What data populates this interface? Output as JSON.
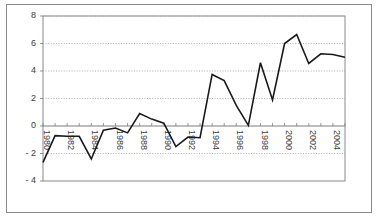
{
  "chart_data": {
    "type": "line",
    "title": "",
    "subtitle": "",
    "xlabel": "",
    "ylabel": "",
    "grid": true,
    "legend": false,
    "legend_position": "none",
    "xlim": [
      1980,
      2005
    ],
    "ylim": [
      -4,
      8
    ],
    "yticks": [
      -4,
      -2,
      0,
      2,
      4,
      6,
      8
    ],
    "ytick_labels": [
      "- 4",
      "- 2",
      "0",
      "2",
      "4",
      "6",
      "8"
    ],
    "xticks": [
      1980,
      1982,
      1984,
      1986,
      1988,
      1990,
      1992,
      1994,
      1996,
      1998,
      2000,
      2002,
      2004
    ],
    "xtick_labels": [
      "1980",
      "1982",
      "1984",
      "1986",
      "1988",
      "1990",
      "1992",
      "1994",
      "1996",
      "1998",
      "2000",
      "2002",
      "2004"
    ],
    "xtick_rotation": 90,
    "x": [
      1980,
      1981,
      1982,
      1983,
      1984,
      1985,
      1986,
      1987,
      1988,
      1989,
      1990,
      1991,
      1992,
      1993,
      1994,
      1995,
      1996,
      1997,
      1998,
      1999,
      2000,
      2001,
      2002,
      2003,
      2004,
      2005
    ],
    "series": [
      {
        "name": "series-1",
        "color": "#1a1a1a",
        "line_width": 1.6,
        "markers": false,
        "values": [
          -2.65,
          -0.7,
          -0.75,
          -0.75,
          -2.4,
          -0.3,
          -0.15,
          -0.5,
          0.9,
          0.5,
          0.2,
          -1.5,
          -0.8,
          -0.85,
          3.75,
          3.3,
          1.5,
          0.05,
          4.6,
          1.9,
          6.0,
          6.65,
          4.55,
          5.25,
          5.2,
          5.0
        ]
      }
    ],
    "colors": {
      "line": "#1a1a1a",
      "grid": "#9a9a9a",
      "axis": "#7d7d7d",
      "frame": "#8a8a8a",
      "background": "#ffffff",
      "tick_text": "#3a3a3a"
    },
    "plot_area": {
      "left": 43,
      "top": 16,
      "right": 345,
      "bottom": 181
    }
  }
}
